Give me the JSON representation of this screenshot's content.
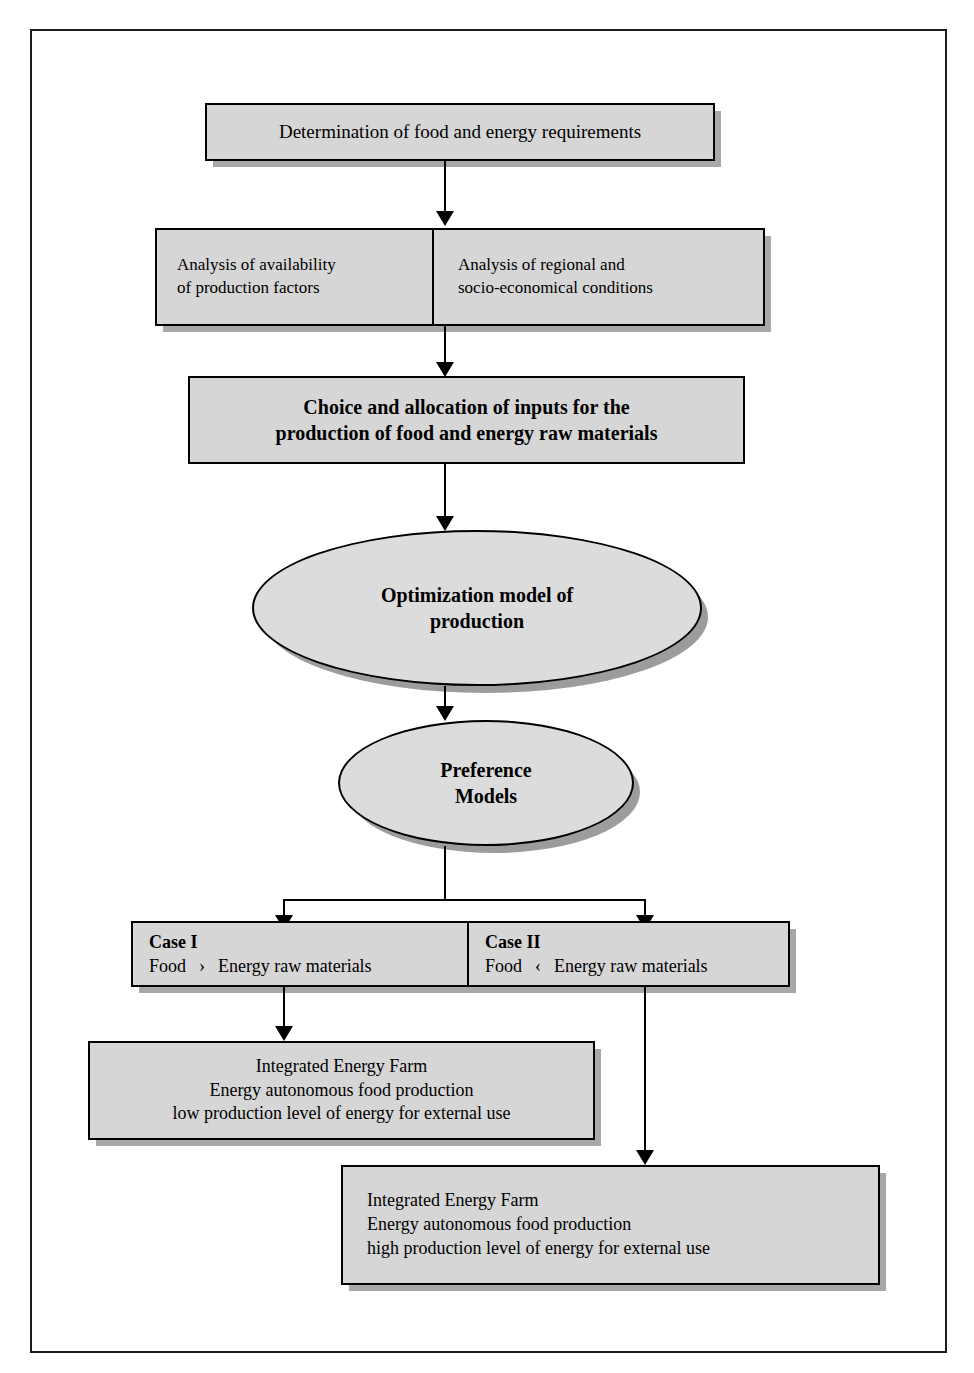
{
  "diagram": {
    "colors": {
      "box_fill": "#d6d6d6",
      "ellipse_fill": "#dcdcdc",
      "border": "#000000",
      "shadow": "#a8a8a8",
      "page_background": "#ffffff"
    },
    "nodes": {
      "requirements": {
        "label": "Determination of food and energy requirements"
      },
      "analysis_factors": {
        "line1": "Analysis of availability",
        "line2": "of production factors"
      },
      "analysis_regional": {
        "line1": "Analysis of regional and",
        "line2": "socio-economical conditions"
      },
      "choice_allocation": {
        "line1": "Choice and allocation of inputs for the",
        "line2": "production of food and energy raw materials"
      },
      "optimization_model": {
        "line1": "Optimization model of",
        "line2": "production"
      },
      "preference_models": {
        "line1": "Preference",
        "line2": "Models"
      },
      "case_one": {
        "heading": "Case I",
        "left_term": "Food",
        "operator": "›",
        "right_term": "Energy raw materials"
      },
      "case_two": {
        "heading": "Case II",
        "left_term": "Food",
        "operator": "‹",
        "right_term": "Energy raw materials"
      },
      "farm_low": {
        "line1": "Integrated Energy Farm",
        "line2": "Energy autonomous food production",
        "line3": "low production level of energy for external use"
      },
      "farm_high": {
        "line1": "Integrated Energy Farm",
        "line2": "Energy autonomous food production",
        "line3": "high production level of energy for external use"
      }
    }
  }
}
